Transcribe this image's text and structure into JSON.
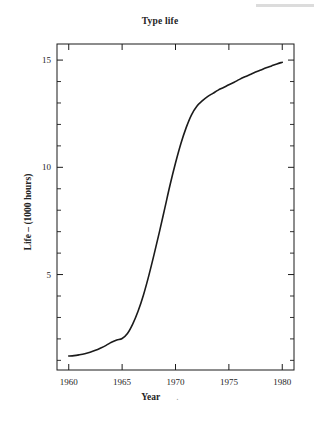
{
  "figure": {
    "background_color": "#ffffff",
    "ink_color": "#1b1b1b",
    "artifact_color": "#dcdcdc"
  },
  "chart_data": {
    "type": "line",
    "title": "Type life",
    "xlabel": "Year",
    "ylabel": "Life – (1000 hours)",
    "xlim": [
      1958.9,
      1981.1
    ],
    "ylim": [
      0.55,
      15.75
    ],
    "grid": false,
    "legend": null,
    "x_ticks": [
      1960,
      1965,
      1970,
      1975,
      1980
    ],
    "x_tick_labels": [
      "1960",
      "1965",
      "1970",
      "1975",
      "1980"
    ],
    "x_minor_ticks": [
      1961,
      1962,
      1963,
      1964,
      1966,
      1967,
      1968,
      1969,
      1971,
      1972,
      1973,
      1974,
      1976,
      1977,
      1978,
      1979
    ],
    "y_ticks": [
      5,
      10,
      15
    ],
    "y_tick_labels": [
      "5",
      "10",
      "15"
    ],
    "y_minor_ticks": [
      1,
      2,
      3,
      4,
      6,
      7,
      8,
      9,
      11,
      12,
      13,
      14
    ],
    "series": [
      {
        "name": "Type life",
        "line_color": "#1b1b1b",
        "line_width": 1.6,
        "x": [
          1960.0,
          1960.5,
          1961.0,
          1961.5,
          1962.0,
          1962.5,
          1963.0,
          1963.5,
          1964.0,
          1964.5,
          1965.0,
          1965.5,
          1966.0,
          1966.5,
          1967.0,
          1967.5,
          1968.0,
          1968.5,
          1969.0,
          1969.5,
          1970.0,
          1970.5,
          1971.0,
          1971.5,
          1972.0,
          1972.5,
          1973.0,
          1973.5,
          1974.0,
          1974.5,
          1975.0,
          1975.5,
          1976.0,
          1976.5,
          1977.0,
          1977.5,
          1978.0,
          1978.5,
          1979.0,
          1979.5,
          1980.0
        ],
        "y": [
          1.2,
          1.22,
          1.26,
          1.31,
          1.38,
          1.47,
          1.58,
          1.7,
          1.84,
          1.95,
          2.02,
          2.25,
          2.7,
          3.3,
          4.05,
          4.95,
          5.95,
          7.0,
          8.1,
          9.2,
          10.2,
          11.1,
          11.85,
          12.45,
          12.85,
          13.1,
          13.3,
          13.45,
          13.6,
          13.72,
          13.85,
          13.97,
          14.1,
          14.22,
          14.33,
          14.44,
          14.54,
          14.64,
          14.73,
          14.82,
          14.9
        ]
      }
    ]
  },
  "geometry": {
    "plot_left": 57,
    "plot_right": 294,
    "plot_top": 44,
    "plot_bottom": 370
  }
}
